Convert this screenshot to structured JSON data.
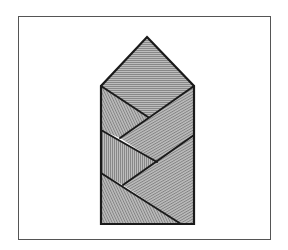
{
  "diagram": {
    "colors": {
      "background": "#ffffff",
      "frame": "#555555",
      "fill": "#b4b4b4",
      "hatch": "#7a7a7a",
      "outline": "#1a1a1a"
    },
    "shape": {
      "apex": [
        147,
        37
      ],
      "rect": {
        "left": 101,
        "top": 86,
        "right": 194,
        "bottom": 224
      }
    },
    "regions": [
      {
        "id": "roof",
        "hatch": "horizontal",
        "points": "147,37 194,86 148,117 101,86"
      },
      {
        "id": "left-upper-strip",
        "hatch": "diagonal-steep",
        "points": "101,86 148,117 120,138 101,130"
      },
      {
        "id": "right-upper-strip",
        "hatch": "diagonal",
        "points": "194,86 194,135 157,162 120,138"
      },
      {
        "id": "left-middle-strip",
        "hatch": "vertical",
        "points": "101,130 157,162 123,185 101,173"
      },
      {
        "id": "right-lower-strip",
        "hatch": "diagonal",
        "points": "194,135 194,224 181,224 123,185"
      },
      {
        "id": "left-lower-strip",
        "hatch": "diagonal-steep",
        "points": "101,173 181,224 101,224"
      }
    ],
    "lines": [
      {
        "id": "line-a",
        "x1": 101,
        "y1": 86,
        "x2": 148,
        "y2": 117
      },
      {
        "id": "line-b",
        "x1": 194,
        "y1": 86,
        "x2": 120,
        "y2": 138
      },
      {
        "id": "line-c",
        "x1": 101,
        "y1": 130,
        "x2": 157,
        "y2": 162
      },
      {
        "id": "line-d",
        "x1": 194,
        "y1": 135,
        "x2": 123,
        "y2": 185
      },
      {
        "id": "line-e",
        "x1": 101,
        "y1": 173,
        "x2": 181,
        "y2": 224
      }
    ]
  }
}
